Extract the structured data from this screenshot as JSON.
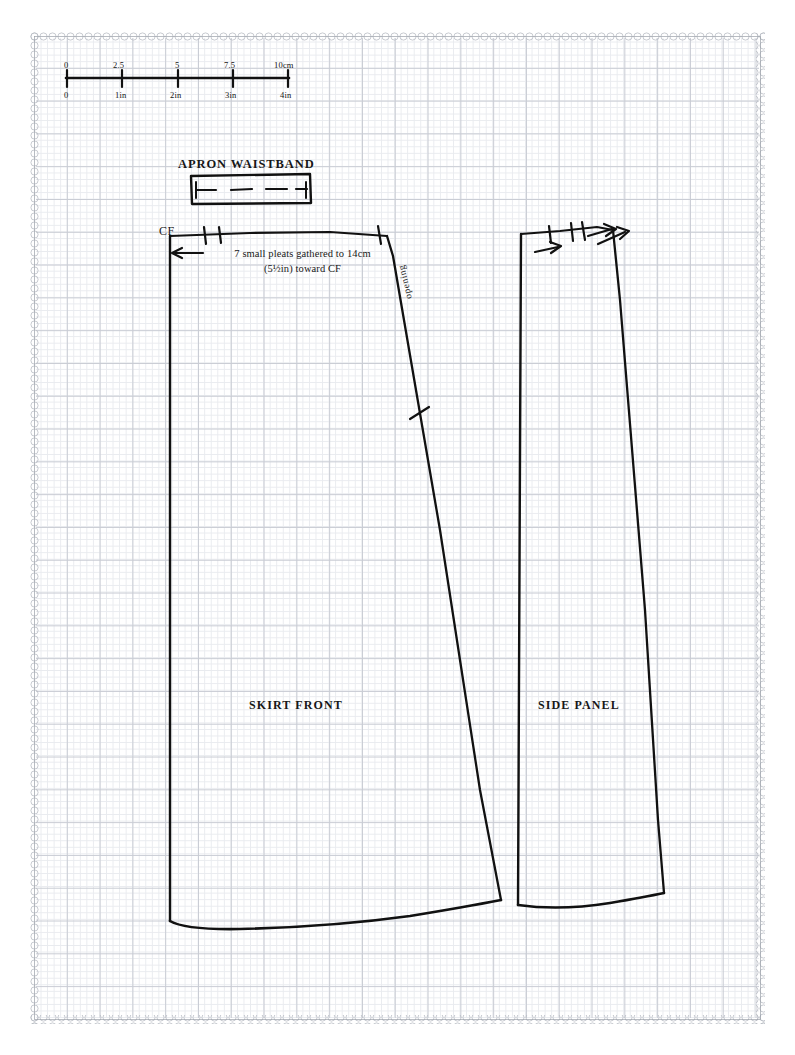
{
  "sheet": {
    "type": "sewing-pattern-sheet",
    "background": "graph-paper",
    "border_style": "scalloped-diamond-chain",
    "ink_color": "#111111",
    "grid_color": "#c9ccd4"
  },
  "scale_bar": {
    "metric_unit": "cm",
    "imperial_unit": "in",
    "metric_labels": [
      "0",
      "2.5",
      "5",
      "7.5",
      "10cm"
    ],
    "imperial_labels": [
      "0",
      "1in",
      "2in",
      "3in",
      "4in"
    ],
    "tick_count": 5
  },
  "pieces": [
    {
      "id": "apron-waistband",
      "title": "APRON WAISTBAND",
      "shape": "rectangle-with-fold-line",
      "fold_line": "dashed"
    },
    {
      "id": "skirt-front",
      "title": "SKIRT FRONT",
      "cf_label": "CF",
      "pleat_note": "7 small pleats gathered to 14cm (5½in) toward CF",
      "opening_label": "opening",
      "top_notches": 2,
      "corner_notches": 1,
      "seam_notches": 1,
      "hem": "curved"
    },
    {
      "id": "side-panel",
      "title": "SIDE PANEL",
      "top_notches": 3,
      "arrows": 2,
      "hem": "curved"
    }
  ],
  "annotations": {
    "cf_arrow_direction": "left",
    "side_panel_arrow_direction": "right"
  }
}
